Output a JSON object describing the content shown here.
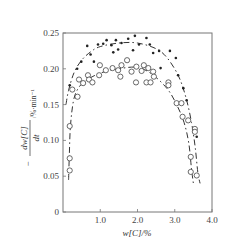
{
  "chart_data": {
    "type": "scatter",
    "title": "",
    "xlabel": "w[C]/%",
    "ylabel": "-dw[C]/dt /%·min⁻¹",
    "ylabel_parts": {
      "minus": "−",
      "numerator": "dw[C]",
      "denominator": "dt",
      "unit": "/%·min⁻¹"
    },
    "xlim": [
      0,
      4.0
    ],
    "ylim": [
      0,
      0.25
    ],
    "x_ticks": [
      {
        "value": 1.0,
        "label": "1.0"
      },
      {
        "value": 2.0,
        "label": "2.0"
      },
      {
        "value": 3.0,
        "label": "3.0"
      },
      {
        "value": 4.0,
        "label": "4.0"
      }
    ],
    "y_ticks": [
      {
        "value": 0,
        "label": "0"
      },
      {
        "value": 0.05,
        "label": "0.05"
      },
      {
        "value": 0.1,
        "label": "0.10"
      },
      {
        "value": 0.15,
        "label": "0.15"
      },
      {
        "value": 0.2,
        "label": "0.20"
      },
      {
        "value": 0.25,
        "label": "0.25"
      }
    ],
    "grid": false,
    "legend": null,
    "series": [
      {
        "name": "filled-dots",
        "marker": "filled-circle",
        "points": [
          [
            0.18,
            0.177
          ],
          [
            0.38,
            0.2
          ],
          [
            0.49,
            0.21
          ],
          [
            0.65,
            0.232
          ],
          [
            0.74,
            0.22
          ],
          [
            0.83,
            0.21
          ],
          [
            0.94,
            0.234
          ],
          [
            1.08,
            0.235
          ],
          [
            1.17,
            0.24
          ],
          [
            1.3,
            0.233
          ],
          [
            1.35,
            0.223
          ],
          [
            1.42,
            0.24
          ],
          [
            1.48,
            0.227
          ],
          [
            1.57,
            0.236
          ],
          [
            1.75,
            0.242
          ],
          [
            1.88,
            0.226
          ],
          [
            1.93,
            0.246
          ],
          [
            2.04,
            0.234
          ],
          [
            2.24,
            0.243
          ],
          [
            2.33,
            0.234
          ],
          [
            2.42,
            0.222
          ],
          [
            2.58,
            0.225
          ],
          [
            2.62,
            0.201
          ],
          [
            2.87,
            0.225
          ],
          [
            3.03,
            0.215
          ],
          [
            3.09,
            0.191
          ],
          [
            3.23,
            0.173
          ],
          [
            3.32,
            0.156
          ],
          [
            3.59,
            0.105
          ]
        ]
      },
      {
        "name": "open-circles",
        "marker": "open-circle",
        "points": [
          [
            0.18,
            0.058
          ],
          [
            0.18,
            0.075
          ],
          [
            0.18,
            0.12
          ],
          [
            0.25,
            0.171
          ],
          [
            0.39,
            0.161
          ],
          [
            0.43,
            0.185
          ],
          [
            0.54,
            0.18
          ],
          [
            0.67,
            0.191
          ],
          [
            0.7,
            0.185
          ],
          [
            0.79,
            0.181
          ],
          [
            0.97,
            0.191
          ],
          [
            0.99,
            0.205
          ],
          [
            1.15,
            0.198
          ],
          [
            1.33,
            0.201
          ],
          [
            1.48,
            0.198
          ],
          [
            1.54,
            0.189
          ],
          [
            1.57,
            0.205
          ],
          [
            1.72,
            0.212
          ],
          [
            1.84,
            0.196
          ],
          [
            1.96,
            0.181
          ],
          [
            1.97,
            0.203
          ],
          [
            2.11,
            0.197
          ],
          [
            2.17,
            0.205
          ],
          [
            2.24,
            0.181
          ],
          [
            2.29,
            0.201
          ],
          [
            2.35,
            0.181
          ],
          [
            2.42,
            0.196
          ],
          [
            2.44,
            0.189
          ],
          [
            2.83,
            0.181
          ],
          [
            2.83,
            0.177
          ],
          [
            3.05,
            0.152
          ],
          [
            3.18,
            0.152
          ],
          [
            3.21,
            0.133
          ],
          [
            3.36,
            0.128
          ],
          [
            3.54,
            0.116
          ],
          [
            3.54,
            0.112
          ],
          [
            3.43,
            0.077
          ],
          [
            3.43,
            0.056
          ],
          [
            3.59,
            0.051
          ]
        ]
      }
    ],
    "fit_curves": [
      {
        "name": "upper-fit (filled dots)",
        "style": "dash-dot",
        "points": [
          [
            0.08,
            0.15
          ],
          [
            0.15,
            0.17
          ],
          [
            0.3,
            0.195
          ],
          [
            0.5,
            0.212
          ],
          [
            0.75,
            0.224
          ],
          [
            1.0,
            0.231
          ],
          [
            1.5,
            0.236
          ],
          [
            2.0,
            0.236
          ],
          [
            2.5,
            0.228
          ],
          [
            2.8,
            0.215
          ],
          [
            3.1,
            0.19
          ],
          [
            3.3,
            0.16
          ],
          [
            3.45,
            0.125
          ],
          [
            3.55,
            0.09
          ],
          [
            3.62,
            0.055
          ],
          [
            3.68,
            0.04
          ]
        ]
      },
      {
        "name": "lower-fit (open circles)",
        "style": "dash-dot",
        "points": [
          [
            0.15,
            0.045
          ],
          [
            0.17,
            0.08
          ],
          [
            0.2,
            0.12
          ],
          [
            0.28,
            0.155
          ],
          [
            0.4,
            0.172
          ],
          [
            0.6,
            0.183
          ],
          [
            1.0,
            0.194
          ],
          [
            1.5,
            0.2
          ],
          [
            2.0,
            0.202
          ],
          [
            2.4,
            0.192
          ],
          [
            2.8,
            0.172
          ],
          [
            3.05,
            0.15
          ],
          [
            3.25,
            0.125
          ],
          [
            3.38,
            0.095
          ],
          [
            3.45,
            0.06
          ],
          [
            3.5,
            0.04
          ]
        ]
      }
    ]
  }
}
